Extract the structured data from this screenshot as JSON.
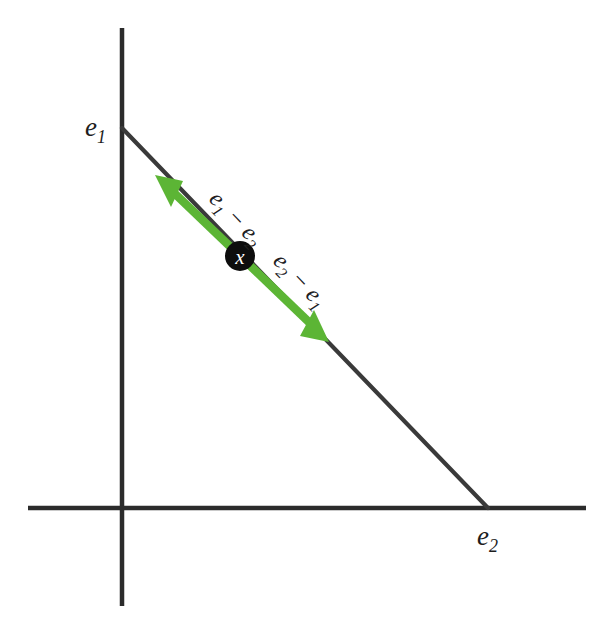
{
  "figure": {
    "background_color": "#ffffff",
    "width": 612,
    "height": 636
  },
  "colors": {
    "axis": "#2b2b2b",
    "segment": "#3a3a3a",
    "vector_green": "#5cb535",
    "point_fill": "#0d0d0d",
    "point_text": "#ffffff",
    "label_text": "#1d1d1d"
  },
  "axes": {
    "vertical": {
      "x": 122,
      "y_top": 28,
      "y_bottom": 606
    },
    "horizontal": {
      "y": 508,
      "x_left": 28,
      "x_right": 586
    }
  },
  "segment": {
    "from": {
      "x": 122,
      "y": 128
    },
    "to": {
      "x": 488,
      "y": 508
    }
  },
  "labels": {
    "e1": {
      "base": "e",
      "sub": "1",
      "x": 85,
      "y": 136
    },
    "e2": {
      "base": "e",
      "sub": "2",
      "x": 477,
      "y": 545
    }
  },
  "point": {
    "name": "x",
    "glyph": "x",
    "x": 240,
    "y": 256,
    "radius": 15
  },
  "vectors": [
    {
      "id": "e1-minus-e2",
      "direction": "up-left",
      "from": {
        "x": 240,
        "y": 256
      },
      "to": {
        "x": 156,
        "y": 176
      },
      "label": {
        "lhs": "e",
        "lhs_sub": "1",
        "op": "−",
        "rhs": "e",
        "rhs_sub": "2"
      },
      "label_x": 208,
      "label_y": 200,
      "label_rotation_deg": 46
    },
    {
      "id": "e2-minus-e1",
      "direction": "down-right",
      "from": {
        "x": 240,
        "y": 256
      },
      "to": {
        "x": 328,
        "y": 341
      },
      "label": {
        "lhs": "e",
        "lhs_sub": "2",
        "op": "−",
        "rhs": "e",
        "rhs_sub": "1"
      },
      "label_x": 272,
      "label_y": 262,
      "label_rotation_deg": 46
    }
  ]
}
